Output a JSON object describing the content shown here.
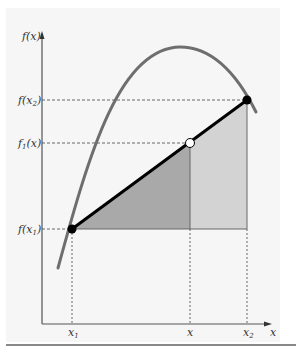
{
  "figure": {
    "type": "linear-interpolation-diagram",
    "y_axis_label": "f(x)",
    "x_axis_label": "x",
    "y_ticks": [
      {
        "id": "fx2",
        "base": "f(x",
        "sub": "2",
        "tail": ")",
        "y": 100
      },
      {
        "id": "f1x",
        "base": "f",
        "sub": "1",
        "tail": "(x)",
        "y": 143
      },
      {
        "id": "fx1",
        "base": "f(x",
        "sub": "1",
        "tail": ")",
        "y": 229
      }
    ],
    "x_ticks": [
      {
        "id": "x1",
        "base": "x",
        "sub": "1",
        "x": 72
      },
      {
        "id": "x",
        "base": "x",
        "sub": "",
        "x": 190
      },
      {
        "id": "x2",
        "base": "x",
        "sub": "2",
        "x": 247
      }
    ],
    "points": {
      "p1": {
        "label": "(x1, f(x1))",
        "fill": "#000000"
      },
      "p_interp": {
        "label": "(x, f1(x))",
        "fill": "#ffffff"
      },
      "p2": {
        "label": "(x2, f(x2))",
        "fill": "#000000"
      }
    },
    "colors": {
      "curve": "#6e6e6e",
      "line": "#000000",
      "dark_shade": "#a9a9a9",
      "light_shade": "#d3d3d3",
      "axis": "#555555",
      "background": "#f6f6f6"
    }
  }
}
